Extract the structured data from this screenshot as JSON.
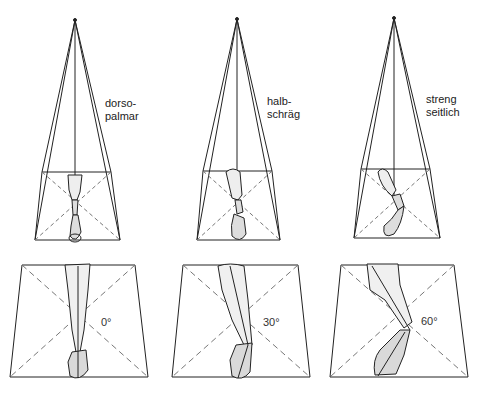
{
  "diagram": {
    "projections": [
      {
        "label_line1": "dorso-",
        "label_line2": "palmar",
        "angle": "0°"
      },
      {
        "label_line1": "halb-",
        "label_line2": "schräg",
        "angle": "30°"
      },
      {
        "label_line1": "streng",
        "label_line2": "seitlich",
        "angle": "60°"
      }
    ]
  },
  "colors": {
    "line": "#222222",
    "bone_fill": "#d9d9d9",
    "background": "#ffffff"
  }
}
